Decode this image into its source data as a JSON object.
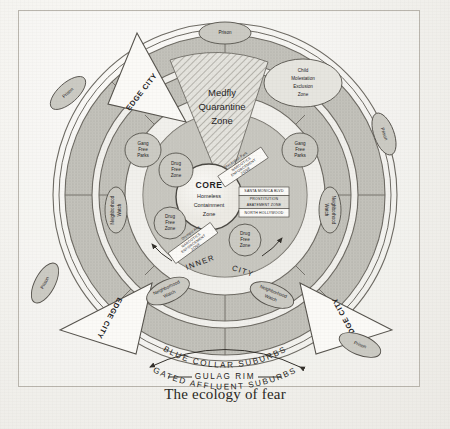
{
  "figure": {
    "caption": "The ecology of fear",
    "title": "The ecology of fear"
  },
  "core": {
    "label": "CORE",
    "line1": "Homeless",
    "line2": "Containment",
    "line3": "Zone"
  },
  "rings": [
    {
      "name": "inner-city",
      "label_left": "INNER",
      "label_right": "CITY"
    },
    {
      "name": "blue-collar-suburbs",
      "label": "BLUE COLLAR SUBURBS"
    },
    {
      "name": "gated-affluent-suburbs",
      "label": "GATED AFFLUENT SUBURBS"
    },
    {
      "name": "gulag-rim",
      "label": "GULAG RIM"
    }
  ],
  "wedges": {
    "medfly": {
      "line1": "Medfly",
      "line2": "Quarantine",
      "line3": "Zone"
    },
    "edge_city": "EDGE CITY"
  },
  "edge_cities": [
    {
      "id": "edge-city-top",
      "label": "EDGE CITY"
    },
    {
      "id": "edge-city-left",
      "label": "EDGE CITY"
    },
    {
      "id": "edge-city-right",
      "label": "EDGE CITY"
    }
  ],
  "prisons": [
    {
      "id": "prison-top",
      "label": "Prison"
    },
    {
      "id": "prison-upper-left",
      "label": "Prison"
    },
    {
      "id": "prison-right",
      "label": "Prison"
    },
    {
      "id": "prison-lower-left",
      "label": "Prison"
    },
    {
      "id": "prison-lower-right",
      "label": "Prison"
    }
  ],
  "zones": {
    "child_molestation": {
      "line1": "Child",
      "line2": "Molestation",
      "line3": "Exclusion",
      "line4": "Zone"
    },
    "gang_free_parks": {
      "line1": "Gang",
      "line2": "Free",
      "line3": "Parks"
    },
    "drug_free_zone": {
      "line1": "Drug",
      "line2": "Free",
      "line3": "Zone"
    },
    "neighborhood_watch": {
      "line1": "Neighborhood",
      "line2": "Watch"
    },
    "prostitution_abatement": {
      "top": "SANTA MONICA BLVD",
      "line1": "PROSTITUTION",
      "line2": "ABATEMENT ZONE",
      "bottom": "NORTH HOLLYWOOD"
    },
    "narcotics_upper": {
      "street": "MacArthur Park",
      "line1": "NARCOTICS",
      "line2": "ENFORCEMENT",
      "line3": "ZONE"
    },
    "narcotics_lower": {
      "street": "Olympic Ave",
      "line1": "NARCOTICS",
      "line2": "ENFORCEMENT",
      "line3": "ZONE"
    }
  },
  "instances": {
    "gang_free_parks": [
      {
        "id": "gang-free-parks-left"
      },
      {
        "id": "gang-free-parks-right"
      }
    ],
    "drug_free_zone": [
      {
        "id": "drug-free-zone-upper-left"
      },
      {
        "id": "drug-free-zone-lower-left"
      },
      {
        "id": "drug-free-zone-lower-right"
      }
    ],
    "neighborhood_watch": [
      {
        "id": "neighborhood-watch-left"
      },
      {
        "id": "neighborhood-watch-right"
      },
      {
        "id": "neighborhood-watch-lower-left"
      },
      {
        "id": "neighborhood-watch-lower-right"
      }
    ]
  },
  "colors": {
    "paper": "#f1f0ec",
    "ring_fill": "#b9b8b1",
    "ring_light": "#dcdbd5",
    "ink": "#24221f",
    "hatch": "#6f6d66"
  }
}
